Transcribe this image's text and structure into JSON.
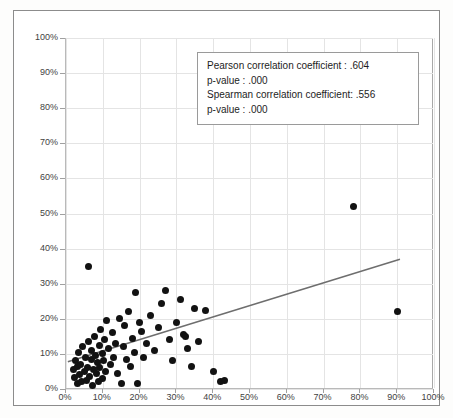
{
  "figure": {
    "background_color": "#ffffff",
    "frame_color": "#8c8c8c",
    "marker_color": "#121212",
    "trendline_color": "#6e6e6e",
    "gridline_color": "#e4e4e4"
  },
  "annotation": {
    "lines": [
      "Pearson correlation coefficient : .604",
      "p-value : .000",
      "Spearman correlation coefficient: .556",
      "p-value : .000"
    ],
    "pearson_label": "Pearson correlation coefficient : .604",
    "pearson_p_label": "p-value : .000",
    "spearman_label": "Spearman correlation coefficient: .556",
    "spearman_p_label": "p-value : .000"
  },
  "chart_data": {
    "type": "scatter",
    "title": "",
    "xlabel": "",
    "ylabel": "",
    "xlim": [
      0,
      100
    ],
    "ylim": [
      0,
      100
    ],
    "grid": true,
    "legend": "none",
    "xtick_labels": [
      "0%",
      "10%",
      "20%",
      "30%",
      "40%",
      "50%",
      "60%",
      "70%",
      "80%",
      "90%",
      "100%"
    ],
    "ytick_labels": [
      "0%",
      "10%",
      "20%",
      "30%",
      "40%",
      "50%",
      "60%",
      "70%",
      "80%",
      "90%",
      "100%"
    ],
    "xticks": [
      0,
      10,
      20,
      30,
      40,
      50,
      60,
      70,
      80,
      90,
      100
    ],
    "yticks": [
      0,
      10,
      20,
      30,
      40,
      50,
      60,
      70,
      80,
      90,
      100
    ],
    "statistics": {
      "pearson_r": 0.604,
      "pearson_p": 0.0,
      "spearman_rho": 0.556,
      "spearman_p": 0.0
    },
    "trendline": {
      "type": "linear",
      "x_start": 0.5,
      "y_start": 7.5,
      "x_end": 91.0,
      "y_end": 36.8
    },
    "points": [
      [
        2.0,
        5.5
      ],
      [
        2.2,
        3.2
      ],
      [
        2.5,
        8.0
      ],
      [
        3.0,
        1.5
      ],
      [
        3.2,
        6.5
      ],
      [
        3.5,
        10.5
      ],
      [
        3.8,
        4.0
      ],
      [
        4.0,
        7.0
      ],
      [
        4.2,
        2.0
      ],
      [
        4.5,
        12.0
      ],
      [
        5.0,
        5.0
      ],
      [
        5.2,
        9.0
      ],
      [
        5.5,
        2.5
      ],
      [
        5.8,
        6.0
      ],
      [
        6.0,
        35.0
      ],
      [
        6.2,
        13.5
      ],
      [
        6.5,
        3.5
      ],
      [
        6.8,
        8.5
      ],
      [
        7.0,
        11.0
      ],
      [
        7.2,
        1.0
      ],
      [
        7.5,
        5.5
      ],
      [
        7.8,
        15.0
      ],
      [
        8.0,
        9.5
      ],
      [
        8.2,
        4.5
      ],
      [
        8.5,
        7.5
      ],
      [
        8.8,
        2.0
      ],
      [
        9.0,
        12.5
      ],
      [
        9.2,
        6.0
      ],
      [
        9.5,
        17.0
      ],
      [
        9.8,
        10.0
      ],
      [
        10.0,
        3.0
      ],
      [
        10.2,
        8.0
      ],
      [
        10.5,
        14.0
      ],
      [
        10.8,
        5.0
      ],
      [
        11.0,
        19.5
      ],
      [
        11.5,
        11.5
      ],
      [
        12.0,
        7.0
      ],
      [
        12.5,
        16.0
      ],
      [
        13.0,
        9.0
      ],
      [
        13.5,
        13.0
      ],
      [
        14.0,
        4.5
      ],
      [
        14.5,
        20.0
      ],
      [
        15.0,
        1.5
      ],
      [
        15.5,
        12.0
      ],
      [
        16.0,
        18.0
      ],
      [
        16.5,
        8.5
      ],
      [
        17.0,
        22.0
      ],
      [
        17.5,
        6.5
      ],
      [
        18.0,
        14.5
      ],
      [
        18.5,
        10.5
      ],
      [
        19.0,
        27.5
      ],
      [
        19.5,
        1.5
      ],
      [
        20.0,
        19.0
      ],
      [
        20.5,
        16.5
      ],
      [
        21.0,
        9.0
      ],
      [
        22.0,
        13.0
      ],
      [
        23.0,
        21.0
      ],
      [
        24.0,
        11.0
      ],
      [
        25.0,
        17.5
      ],
      [
        26.0,
        24.5
      ],
      [
        27.0,
        28.0
      ],
      [
        28.0,
        14.0
      ],
      [
        29.0,
        8.0
      ],
      [
        30.0,
        19.0
      ],
      [
        31.0,
        25.5
      ],
      [
        32.0,
        15.5
      ],
      [
        32.5,
        15.0
      ],
      [
        33.0,
        11.5
      ],
      [
        34.0,
        6.5
      ],
      [
        35.0,
        23.0
      ],
      [
        36.0,
        13.5
      ],
      [
        38.0,
        22.5
      ],
      [
        40.0,
        5.0
      ],
      [
        42.0,
        2.0
      ],
      [
        43.0,
        2.5
      ],
      [
        78.0,
        52.0
      ],
      [
        90.0,
        22.0
      ]
    ]
  }
}
